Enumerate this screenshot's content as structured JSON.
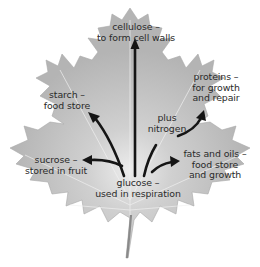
{
  "diagram": {
    "source_label": {
      "line1": "glucose –",
      "line2": "used in respiration"
    },
    "labels": {
      "cellulose": {
        "line1": "cellulose –",
        "line2": "to form cell walls"
      },
      "starch": {
        "line1": "starch –",
        "line2": "food store"
      },
      "proteins": {
        "line1": "proteins –",
        "line2": "for growth",
        "line3": "and repair"
      },
      "nitrogen": {
        "line1": "plus",
        "line2": "nitrogen"
      },
      "sucrose": {
        "line1": "sucrose –",
        "line2": "stored in fruit"
      },
      "fats": {
        "line1": "fats and oils –",
        "line2": "food store",
        "line3": "and growth"
      }
    },
    "colors": {
      "leaf_fill": "#b9b9b9",
      "leaf_highlight": "#e2e2e2",
      "arrow": "#151515",
      "text": "#2a2a2a",
      "background": "#ffffff"
    }
  }
}
